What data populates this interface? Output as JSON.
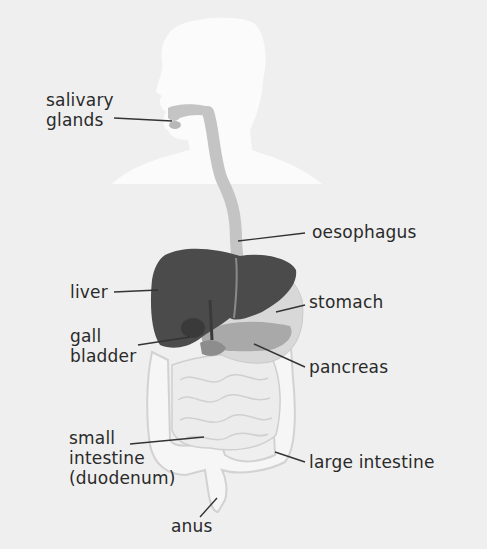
{
  "colors": {
    "background": "#efefef",
    "silhouette": "#fbfbfb",
    "tract": "#c4c4c4",
    "liver": "#4a4a4a",
    "stomach": "#d6d6d6",
    "pancreas": "#a8a8a8",
    "intestine": "#f5f5f5",
    "label_line": "#333333"
  },
  "labels": {
    "salivary_glands": [
      "salivary",
      "glands"
    ],
    "oesophagus": "oesophagus",
    "liver": "liver",
    "stomach": "stomach",
    "gall_bladder": [
      "gall",
      "bladder"
    ],
    "pancreas": "pancreas",
    "small_intestine": [
      "small",
      "intestine",
      "(duodenum)"
    ],
    "large_intestine": "large intestine",
    "anus": "anus"
  }
}
